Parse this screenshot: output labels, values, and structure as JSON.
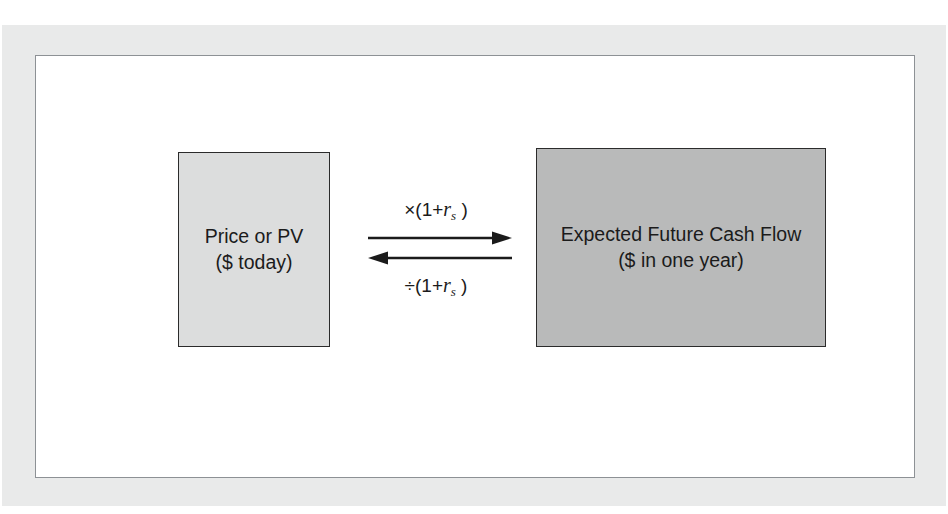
{
  "figure": {
    "name": "present-value-relationship-diagram",
    "frame": {
      "mat_color": "#e9eaea",
      "border_color": "#8d9195",
      "background": "#ffffff"
    }
  },
  "nodes": [
    {
      "id": "price-or-pv",
      "line1": "Price or PV",
      "line2": "($ today)",
      "fill": "#dcdddd",
      "stroke": "#2b2b2b"
    },
    {
      "id": "expected-future-cash-flow",
      "line1": "Expected Future Cash Flow",
      "line2": "($ in one year)",
      "fill": "#b9baba",
      "stroke": "#2b2b2b"
    }
  ],
  "relation": {
    "forward": {
      "operator": "×",
      "expression_prefix": "(1+",
      "variable": "r",
      "subscript": "s",
      "expression_suffix": " )",
      "full_text": "×(1+r s )",
      "direction": "right",
      "meaning": "compound to future value"
    },
    "backward": {
      "operator": "÷",
      "expression_prefix": "(1+",
      "variable": "r",
      "subscript": "s",
      "expression_suffix": " )",
      "full_text": "÷(1+r s )",
      "direction": "left",
      "meaning": "discount to present value"
    },
    "arrow_color": "#1b1b1b"
  }
}
